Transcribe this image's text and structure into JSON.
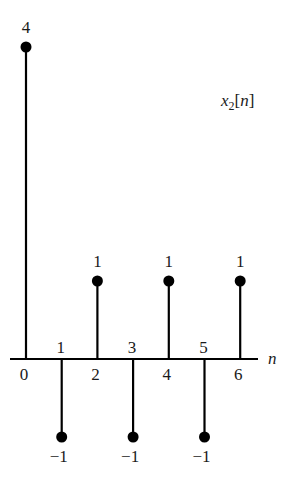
{
  "chart_data": {
    "type": "stem",
    "title": "x2[n]",
    "title_parts": {
      "base": "x",
      "sub": "2",
      "arg": "[n]"
    },
    "xlabel": "n",
    "ylabel": "",
    "x": [
      0,
      1,
      2,
      3,
      4,
      5,
      6
    ],
    "values": [
      4,
      -1,
      1,
      -1,
      1,
      -1,
      1
    ],
    "value_labels": [
      "4",
      "−1",
      "1",
      "−1",
      "1",
      "−1",
      "1"
    ],
    "tick_labels": [
      "0",
      "1",
      "2",
      "3",
      "4",
      "5",
      "6"
    ],
    "ylim": [
      -1,
      4
    ],
    "grid": false,
    "legend": null,
    "colors": {
      "stem": "#000000",
      "text": "#1a1a1a",
      "background": "#ffffff"
    }
  }
}
